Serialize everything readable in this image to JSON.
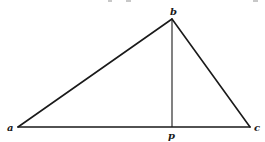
{
  "diagram": {
    "type": "triangle-with-altitude",
    "vertices": [
      {
        "id": "a",
        "label": "a",
        "x": 18,
        "y": 127
      },
      {
        "id": "b",
        "label": "b",
        "x": 172,
        "y": 19
      },
      {
        "id": "c",
        "label": "c",
        "x": 250,
        "y": 127
      }
    ],
    "foot": {
      "id": "p",
      "label": "p",
      "x": 172,
      "y": 127
    },
    "edges": [
      {
        "from": "a",
        "to": "b"
      },
      {
        "from": "b",
        "to": "c"
      },
      {
        "from": "a",
        "to": "c"
      }
    ],
    "altitude": {
      "from": "b",
      "to": "p"
    },
    "colors": {
      "stroke": "#1a1a1a",
      "background": "#ffffff"
    }
  },
  "labels": {
    "a": "a",
    "b": "b",
    "c": "c",
    "p": "p"
  }
}
